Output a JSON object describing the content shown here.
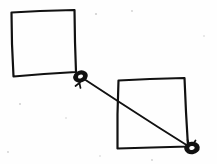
{
  "diagram": {
    "type": "sketch-diagram",
    "background_color": "#fefefe",
    "ink_color": "#111111",
    "width": 217,
    "height": 164,
    "stroke_width": 2.1,
    "shapes": [
      {
        "id": "square-top-left",
        "name": "Top-left square",
        "kind": "quadrilateral",
        "label": "",
        "path": "M 11.5 12.5 L 40 11.0 L 74.5 10.0 L 75.0 42 L 76.0 72.0 L 44 74 L 13.5 76.5 L 12.0 44 Z",
        "closed": true
      },
      {
        "id": "square-bottom-right",
        "name": "Bottom-right square",
        "kind": "quadrilateral",
        "label": "",
        "path": "M 118.5 80.5 L 150 79.0 L 184.5 78.0 L 186.0 112 L 188.0 146.5 L 152 147.5 L 117.5 148.5 L 117.5 114 Z",
        "closed": true
      }
    ],
    "connector": {
      "id": "connector-line",
      "name": "Connector line",
      "from_node": "node-junction",
      "to_node": "node-endpoint",
      "path": "M 82.5 78.0 L 120 102.5 L 158 127.0 L 190.5 147.5",
      "label": ""
    },
    "nodes": [
      {
        "id": "node-junction",
        "name": "Junction knot",
        "cx": 80.5,
        "cy": 76.5,
        "rx": 6.2,
        "ry": 4.6,
        "rotation": -20,
        "hole_rx": 2.6,
        "hole_ry": 1.9,
        "tick_path": "M 79.0 81.0 L 80.5 88.0 M 80.0 82.5 L 75.5 86.0"
      },
      {
        "id": "node-endpoint",
        "name": "Endpoint knot",
        "cx": 192.0,
        "cy": 148.0,
        "rx": 6.4,
        "ry": 4.8,
        "rotation": -8,
        "hole_rx": 2.7,
        "hole_ry": 2.0,
        "tick_path": "M 187.5 140.0 L 189.5 144.5 M 195.5 140.5 L 193.0 144.5"
      }
    ],
    "specks": [
      {
        "cx": 96,
        "cy": 14,
        "r": 1.1
      },
      {
        "cx": 132,
        "cy": 11,
        "r": 0.9
      },
      {
        "cx": 20,
        "cy": 104,
        "r": 1.0
      },
      {
        "cx": 66,
        "cy": 118,
        "r": 0.8
      },
      {
        "cx": 152,
        "cy": 160,
        "r": 0.9
      },
      {
        "cx": 204,
        "cy": 36,
        "r": 0.8
      },
      {
        "cx": 8,
        "cy": 152,
        "r": 0.9
      },
      {
        "cx": 100,
        "cy": 156,
        "r": 0.8
      }
    ]
  }
}
